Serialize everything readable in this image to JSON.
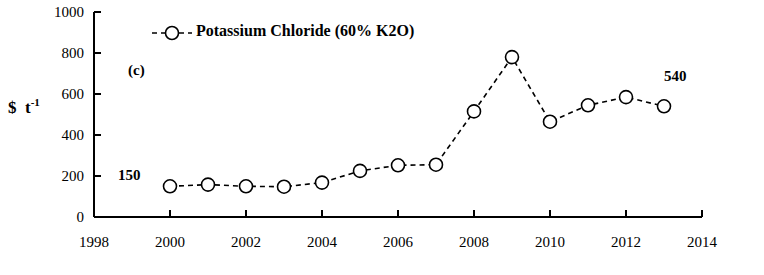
{
  "chart_data": {
    "type": "line",
    "title": "",
    "panel_tag": "(c)",
    "xlabel": "",
    "ylabel": "$  t-1",
    "xlim": [
      1998,
      2014
    ],
    "ylim": [
      0,
      1000
    ],
    "xticks": [
      1998,
      2000,
      2002,
      2004,
      2006,
      2008,
      2010,
      2012,
      2014
    ],
    "yticks": [
      0,
      200,
      400,
      600,
      800,
      1000
    ],
    "grid": false,
    "legend_position": "top-left-inside",
    "series": [
      {
        "name": "Potassium Chloride (60% K2O)",
        "marker": "circle-open",
        "line_style": "dashed",
        "color": "#000000",
        "x": [
          2000,
          2001,
          2002,
          2003,
          2004,
          2005,
          2006,
          2007,
          2008,
          2009,
          2010,
          2011,
          2012,
          2013
        ],
        "values": [
          150,
          158,
          150,
          148,
          168,
          225,
          252,
          255,
          515,
          780,
          465,
          545,
          585,
          540
        ]
      }
    ],
    "annotations": [
      {
        "text": "150",
        "x": 2000,
        "y": 150,
        "dx": -4,
        "dy": 52
      },
      {
        "text": "540",
        "x": 2013,
        "y": 540,
        "dx": 2,
        "dy": 42
      }
    ],
    "legend": [
      {
        "label": "Potassium Chloride (60% K2O)"
      }
    ]
  }
}
